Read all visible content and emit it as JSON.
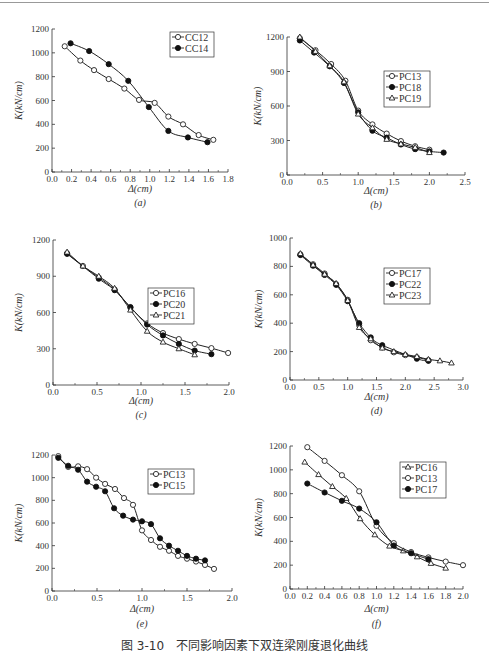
{
  "caption": "图 3-10　不同影响因素下双连梁刚度退化曲线",
  "chart_data": [
    {
      "id": "a",
      "type": "line",
      "panel_label": "(a)",
      "xlabel": "Δ(cm)",
      "ylabel": "K(kN/cm)",
      "xlim": [
        0.0,
        1.8
      ],
      "ylim": [
        0,
        1200
      ],
      "xticks": [
        "0.0",
        "0.2",
        "0.4",
        "0.6",
        "0.8",
        "1.0",
        "1.2",
        "1.4",
        "1.6",
        "1.8"
      ],
      "yticks": [
        "0",
        "200",
        "400",
        "600",
        "800",
        "1000",
        "1200"
      ],
      "legend_position": "upper right",
      "series": [
        {
          "name": "CC12",
          "marker": "open-circle",
          "x": [
            0.13,
            0.29,
            0.43,
            0.58,
            0.74,
            0.89,
            1.05,
            1.19,
            1.34,
            1.5,
            1.65
          ],
          "y": [
            1055,
            935,
            855,
            780,
            700,
            605,
            580,
            465,
            400,
            310,
            270
          ]
        },
        {
          "name": "CC14",
          "marker": "filled-circle",
          "x": [
            0.19,
            0.38,
            0.58,
            0.78,
            0.99,
            1.19,
            1.39,
            1.59
          ],
          "y": [
            1080,
            1015,
            905,
            765,
            545,
            345,
            290,
            250
          ]
        }
      ]
    },
    {
      "id": "b",
      "type": "line",
      "panel_label": "(b)",
      "xlabel": "Δ(cm)",
      "ylabel": "K(kN/cm)",
      "xlim": [
        0.0,
        2.5
      ],
      "ylim": [
        0,
        1200
      ],
      "xticks": [
        "0.0",
        "0.5",
        "1.0",
        "1.5",
        "2.0",
        "2.5"
      ],
      "yticks": [
        "0",
        "300",
        "600",
        "900",
        "1200"
      ],
      "legend_position": "center right",
      "series": [
        {
          "name": "PC13",
          "marker": "open-circle",
          "x": [
            0.18,
            0.4,
            0.62,
            0.82,
            1.0,
            1.2,
            1.4,
            1.6,
            1.8,
            2.0
          ],
          "y": [
            1190,
            1085,
            965,
            820,
            560,
            440,
            360,
            295,
            250,
            220
          ]
        },
        {
          "name": "PC18",
          "marker": "filled-circle",
          "x": [
            0.18,
            0.38,
            0.6,
            0.8,
            1.0,
            1.2,
            1.4,
            1.6,
            1.8,
            2.0,
            2.2
          ],
          "y": [
            1170,
            1065,
            945,
            800,
            545,
            385,
            325,
            265,
            225,
            205,
            195
          ]
        },
        {
          "name": "PC19",
          "marker": "open-triangle",
          "x": [
            0.18,
            0.4,
            0.6,
            0.8,
            1.0,
            1.2,
            1.4,
            1.6,
            1.8,
            2.0
          ],
          "y": [
            1200,
            1075,
            950,
            810,
            530,
            410,
            310,
            270,
            240,
            195
          ]
        }
      ]
    },
    {
      "id": "c",
      "type": "line",
      "panel_label": "(c)",
      "xlabel": "Δ(cm)",
      "ylabel": "K(kN/cm)",
      "xlim": [
        0.0,
        2.0
      ],
      "ylim": [
        0,
        1200
      ],
      "xticks": [
        "0.0",
        "0.5",
        "1.0",
        "1.5",
        "2.0"
      ],
      "yticks": [
        "0",
        "300",
        "600",
        "900",
        "1200"
      ],
      "legend_position": "center right",
      "series": [
        {
          "name": "PC16",
          "marker": "open-circle",
          "x": [
            0.16,
            0.34,
            0.52,
            0.7,
            0.88,
            1.07,
            1.25,
            1.43,
            1.61,
            1.8,
            1.99
          ],
          "y": [
            1090,
            985,
            890,
            790,
            640,
            510,
            430,
            380,
            340,
            305,
            265
          ]
        },
        {
          "name": "PC20",
          "marker": "filled-circle",
          "x": [
            0.16,
            0.52,
            0.7,
            0.88,
            1.07,
            1.25,
            1.43,
            1.61,
            1.8
          ],
          "y": [
            1085,
            880,
            785,
            645,
            500,
            410,
            340,
            285,
            255
          ]
        },
        {
          "name": "PC21",
          "marker": "open-triangle",
          "x": [
            0.16,
            0.34,
            0.52,
            0.7,
            0.88,
            1.07,
            1.25,
            1.43,
            1.61
          ],
          "y": [
            1100,
            985,
            900,
            800,
            620,
            445,
            355,
            300,
            250
          ]
        }
      ]
    },
    {
      "id": "d",
      "type": "line",
      "panel_label": "(d)",
      "xlabel": "Δ(cm)",
      "ylabel": "K(kN/cm)",
      "xlim": [
        0.0,
        3.0
      ],
      "ylim": [
        0,
        1000
      ],
      "xticks": [
        "0.0",
        "0.5",
        "1.0",
        "1.5",
        "2.0",
        "2.5",
        "3.0"
      ],
      "yticks": [
        "0",
        "200",
        "400",
        "600",
        "800",
        "1000"
      ],
      "legend_position": "upper right",
      "series": [
        {
          "name": "PC17",
          "marker": "open-circle",
          "x": [
            0.18,
            0.4,
            0.6,
            0.8,
            1.0,
            1.2,
            1.4,
            1.6,
            1.8,
            2.0,
            2.2,
            2.4
          ],
          "y": [
            885,
            815,
            750,
            675,
            565,
            385,
            280,
            230,
            195,
            175,
            160,
            140
          ]
        },
        {
          "name": "PC22",
          "marker": "filled-circle",
          "x": [
            0.18,
            0.4,
            0.6,
            0.8,
            1.0,
            1.2,
            1.4,
            1.6,
            2.2,
            2.4
          ],
          "y": [
            880,
            805,
            740,
            670,
            555,
            400,
            300,
            245,
            150,
            135
          ]
        },
        {
          "name": "PC23",
          "marker": "open-triangle",
          "x": [
            0.18,
            0.4,
            0.6,
            0.8,
            1.0,
            1.2,
            1.4,
            1.6,
            1.8,
            2.0,
            2.2,
            2.4,
            2.6,
            2.8
          ],
          "y": [
            890,
            810,
            745,
            680,
            560,
            370,
            290,
            225,
            200,
            180,
            165,
            145,
            135,
            120
          ]
        }
      ]
    },
    {
      "id": "e",
      "type": "line",
      "panel_label": "(e)",
      "xlabel": "Δ(cm)",
      "ylabel": "K(kN/cm)",
      "xlim": [
        0.0,
        2.0
      ],
      "ylim": [
        0,
        1200
      ],
      "xticks": [
        "0.0",
        "0.5",
        "1.0",
        "1.5",
        "2.0"
      ],
      "yticks": [
        "0",
        "200",
        "400",
        "600",
        "800",
        "1000",
        "1200"
      ],
      "legend_position": "upper right",
      "series": [
        {
          "name": "PC13",
          "marker": "open-circle",
          "x": [
            0.07,
            0.18,
            0.29,
            0.39,
            0.49,
            0.59,
            0.7,
            0.8,
            0.9,
            1.0,
            1.1,
            1.2,
            1.3,
            1.4,
            1.5,
            1.6,
            1.7,
            1.8
          ],
          "y": [
            1190,
            1095,
            1100,
            1075,
            1000,
            945,
            900,
            820,
            760,
            535,
            450,
            390,
            355,
            310,
            285,
            260,
            230,
            195
          ]
        },
        {
          "name": "PC15",
          "marker": "filled-circle",
          "x": [
            0.07,
            0.18,
            0.29,
            0.39,
            0.49,
            0.59,
            0.69,
            0.79,
            0.9,
            1.0,
            1.1,
            1.2,
            1.3,
            1.4,
            1.5,
            1.6,
            1.7
          ],
          "y": [
            1175,
            1105,
            1070,
            965,
            920,
            880,
            730,
            665,
            630,
            615,
            590,
            465,
            400,
            355,
            310,
            285,
            270
          ]
        }
      ]
    },
    {
      "id": "f",
      "type": "line",
      "panel_label": "(f)",
      "xlabel": "Δ(cm)",
      "ylabel": "K(kN/cm)",
      "xlim": [
        0.0,
        2.0
      ],
      "ylim": [
        0,
        1200
      ],
      "xticks": [
        "0.0",
        "0.2",
        "0.4",
        "0.6",
        "0.8",
        "1.0",
        "1.2",
        "1.4",
        "1.6",
        "1.8",
        "2.0"
      ],
      "yticks": [
        "0",
        "200",
        "400",
        "600",
        "800",
        "1000",
        "1200"
      ],
      "legend_position": "upper right",
      "series": [
        {
          "name": "PC16",
          "marker": "open-triangle",
          "x": [
            0.17,
            0.33,
            0.49,
            0.65,
            0.81,
            0.98,
            1.15,
            1.31,
            1.47,
            1.63,
            1.8
          ],
          "y": [
            1065,
            960,
            860,
            760,
            590,
            455,
            360,
            320,
            270,
            215,
            175
          ]
        },
        {
          "name": "PC13",
          "marker": "open-circle",
          "x": [
            0.2,
            0.4,
            0.6,
            0.8,
            1.0,
            1.2,
            1.4,
            1.6,
            1.8,
            2.0
          ],
          "y": [
            1190,
            1075,
            955,
            820,
            530,
            385,
            310,
            265,
            230,
            200
          ]
        },
        {
          "name": "PC17",
          "marker": "filled-circle",
          "x": [
            0.2,
            0.4,
            0.6,
            0.8,
            1.0,
            1.2,
            1.4,
            1.6
          ],
          "y": [
            885,
            810,
            740,
            675,
            560,
            365,
            300,
            250
          ]
        }
      ]
    }
  ]
}
